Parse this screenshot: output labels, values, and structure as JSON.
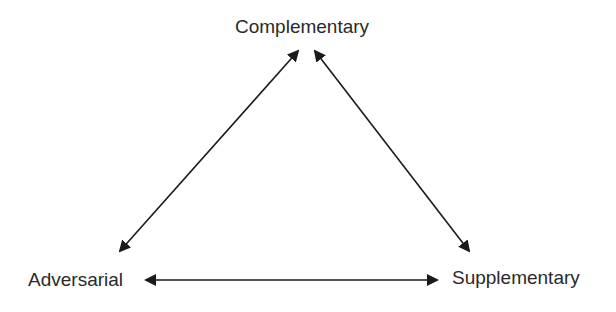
{
  "diagram": {
    "type": "triangle-relationship",
    "nodes": [
      {
        "id": "complementary",
        "label": "Complementary"
      },
      {
        "id": "adversarial",
        "label": "Adversarial"
      },
      {
        "id": "supplementary",
        "label": "Supplementary"
      }
    ],
    "edges": [
      {
        "from": "complementary",
        "to": "adversarial",
        "direction": "bidirectional"
      },
      {
        "from": "complementary",
        "to": "supplementary",
        "direction": "bidirectional"
      },
      {
        "from": "adversarial",
        "to": "supplementary",
        "direction": "bidirectional"
      }
    ],
    "colors": {
      "line": "#1a1a1a",
      "text": "#2a2a2a",
      "background": "#ffffff"
    }
  }
}
